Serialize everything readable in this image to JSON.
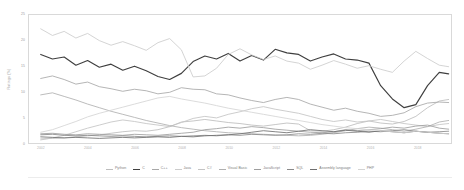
{
  "chart_data": {
    "type": "line",
    "title": "",
    "xlabel": "",
    "ylabel": "Ratings (%)",
    "ylim": [
      0,
      25
    ],
    "xlim": [
      2001.5,
      2019.5
    ],
    "grid": false,
    "legend_position": "bottom",
    "yticks": [
      "0",
      "5",
      "10",
      "15",
      "20",
      "25"
    ],
    "ytick_values": [
      0,
      5,
      10,
      15,
      20,
      25
    ],
    "xticks": [
      "2002",
      "2004",
      "2006",
      "2008",
      "2010",
      "2012",
      "2014",
      "2016",
      "2018"
    ],
    "xtick_values": [
      2002,
      2004,
      2006,
      2008,
      2010,
      2012,
      2014,
      2016,
      2018
    ],
    "x": [
      2002.0,
      2002.5,
      2003.0,
      2003.5,
      2004.0,
      2004.5,
      2005.0,
      2005.5,
      2006.0,
      2006.5,
      2007.0,
      2007.5,
      2008.0,
      2008.5,
      2009.0,
      2009.5,
      2010.0,
      2010.5,
      2011.0,
      2011.5,
      2012.0,
      2012.5,
      2013.0,
      2013.5,
      2014.0,
      2014.5,
      2015.0,
      2015.5,
      2016.0,
      2016.5,
      2017.0,
      2017.5,
      2018.0,
      2018.5,
      2019.0,
      2019.4
    ],
    "series": [
      {
        "name": "Python",
        "color": "#bdbdbd",
        "values": [
          0.8,
          0.9,
          1.0,
          1.2,
          1.4,
          1.6,
          1.9,
          2.2,
          2.4,
          2.3,
          2.6,
          3.2,
          4.1,
          4.3,
          4.6,
          4.3,
          4.0,
          3.8,
          3.5,
          3.3,
          3.6,
          3.9,
          3.7,
          2.4,
          2.3,
          2.6,
          3.1,
          3.8,
          4.3,
          3.9,
          3.7,
          4.2,
          5.2,
          6.9,
          8.2,
          8.5
        ]
      },
      {
        "name": "C",
        "color": "#3f3f3f",
        "values": [
          17.3,
          16.4,
          16.8,
          15.2,
          16.1,
          14.8,
          15.4,
          14.2,
          15.0,
          14.1,
          13.0,
          12.4,
          13.6,
          15.9,
          17.0,
          16.4,
          17.5,
          16.0,
          17.1,
          16.2,
          18.3,
          17.6,
          17.3,
          16.0,
          16.8,
          17.4,
          16.4,
          16.2,
          15.6,
          11.2,
          8.6,
          6.9,
          7.5,
          11.2,
          13.8,
          13.5
        ]
      },
      {
        "name": "C++",
        "color": "#a8a8a8",
        "values": [
          12.6,
          13.1,
          12.4,
          11.5,
          11.9,
          11.0,
          10.6,
          10.1,
          10.5,
          10.2,
          9.6,
          9.9,
          10.8,
          10.5,
          10.4,
          9.6,
          9.4,
          8.8,
          8.3,
          7.9,
          8.5,
          8.9,
          8.5,
          7.6,
          7.0,
          6.4,
          6.8,
          6.2,
          5.8,
          5.2,
          5.4,
          5.9,
          7.1,
          7.8,
          8.0,
          7.9
        ]
      },
      {
        "name": "Java",
        "color": "#cccccc",
        "values": [
          22.3,
          21.0,
          21.8,
          20.5,
          21.4,
          20.0,
          19.1,
          19.8,
          19.0,
          18.1,
          19.6,
          20.4,
          18.2,
          12.9,
          13.1,
          14.6,
          17.3,
          18.4,
          17.2,
          16.3,
          17.0,
          16.0,
          15.6,
          14.4,
          15.2,
          16.1,
          15.4,
          14.6,
          15.1,
          14.4,
          13.8,
          16.0,
          17.9,
          16.5,
          15.2,
          14.9
        ]
      },
      {
        "name": "C#",
        "color": "#c4c4c4",
        "values": [
          0.6,
          1.0,
          1.5,
          2.2,
          2.9,
          3.5,
          4.1,
          4.5,
          4.2,
          3.8,
          3.5,
          3.2,
          4.0,
          4.8,
          5.2,
          4.9,
          5.6,
          6.1,
          6.7,
          7.1,
          6.6,
          6.2,
          5.8,
          5.2,
          4.6,
          4.2,
          4.5,
          4.1,
          4.3,
          4.6,
          4.2,
          3.8,
          3.5,
          3.2,
          3.6,
          3.8
        ]
      },
      {
        "name": "Visual Basic",
        "color": "#b0b0b0",
        "values": [
          9.4,
          9.8,
          9.1,
          8.4,
          7.6,
          6.9,
          6.2,
          5.6,
          5.0,
          4.4,
          3.9,
          3.4,
          3.0,
          2.7,
          2.4,
          2.2,
          2.0,
          1.9,
          1.8,
          1.7,
          1.6,
          1.5,
          1.4,
          1.5,
          1.7,
          2.0,
          2.4,
          2.8,
          3.1,
          2.9,
          2.6,
          2.3,
          2.7,
          3.2,
          4.1,
          4.4
        ]
      },
      {
        "name": "JavaScript",
        "color": "#9e9e9e",
        "values": [
          1.8,
          1.9,
          1.7,
          1.6,
          1.8,
          1.7,
          1.6,
          1.5,
          1.7,
          1.6,
          1.5,
          1.7,
          1.9,
          2.1,
          2.6,
          2.8,
          3.1,
          2.9,
          3.2,
          3.0,
          2.7,
          2.5,
          2.3,
          2.1,
          2.0,
          2.2,
          2.6,
          2.4,
          2.6,
          2.8,
          3.1,
          2.9,
          3.3,
          3.5,
          2.9,
          2.7
        ]
      },
      {
        "name": "SQL",
        "color": "#8a8a8a",
        "values": [
          1.6,
          1.7,
          1.5,
          1.4,
          1.5,
          1.4,
          1.3,
          1.4,
          1.3,
          1.2,
          1.3,
          1.4,
          1.3,
          1.4,
          1.5,
          1.4,
          1.6,
          1.5,
          1.7,
          1.6,
          1.5,
          1.6,
          1.8,
          1.7,
          1.9,
          1.8,
          2.0,
          2.1,
          2.3,
          2.2,
          2.4,
          2.6,
          2.3,
          2.1,
          2.2,
          2.3
        ]
      },
      {
        "name": "Assembly language",
        "color": "#6f6f6f",
        "values": [
          1.2,
          1.1,
          1.0,
          1.1,
          1.0,
          0.9,
          1.0,
          1.1,
          1.0,
          1.1,
          1.2,
          1.1,
          1.3,
          1.2,
          1.4,
          1.5,
          1.6,
          1.8,
          2.1,
          2.4,
          2.2,
          2.0,
          2.3,
          2.6,
          2.4,
          2.2,
          2.5,
          2.3,
          2.1,
          2.4,
          2.2,
          2.0,
          2.3,
          2.1,
          1.9,
          1.8
        ]
      },
      {
        "name": "PHP",
        "color": "#d4d4d4",
        "values": [
          2.1,
          2.6,
          3.4,
          4.2,
          5.1,
          5.8,
          6.4,
          7.0,
          7.6,
          8.2,
          8.8,
          9.1,
          8.6,
          8.2,
          7.8,
          7.3,
          6.8,
          6.4,
          6.0,
          5.6,
          5.2,
          4.8,
          4.4,
          4.0,
          3.6,
          3.3,
          3.0,
          2.8,
          2.6,
          2.4,
          2.2,
          2.0,
          2.3,
          2.1,
          1.9,
          1.8
        ]
      }
    ]
  }
}
